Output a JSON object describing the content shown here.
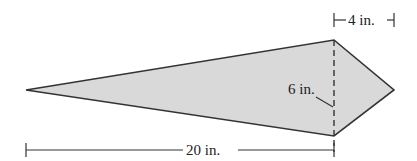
{
  "figure": {
    "shape": "kite",
    "fill_color": "#d9d9d9",
    "stroke_color": "#333333",
    "labels": {
      "length": "20 in.",
      "width_right": "4 in.",
      "height": "6 in."
    }
  }
}
